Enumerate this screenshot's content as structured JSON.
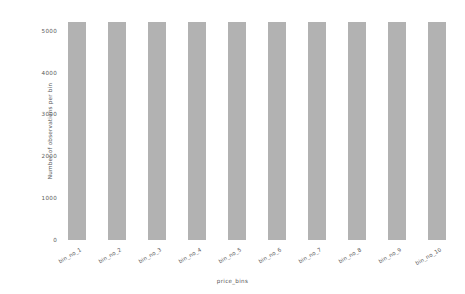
{
  "chart_data": {
    "type": "bar",
    "title": "",
    "categories": [
      "bin_no_1",
      "bin_no_2",
      "bin_no_3",
      "bin_no_4",
      "bin_no_5",
      "bin_no_6",
      "bin_no_7",
      "bin_no_8",
      "bin_no_9",
      "bin_no_10"
    ],
    "values": [
      5200,
      5200,
      5200,
      5200,
      5200,
      5200,
      5200,
      5200,
      5200,
      5200
    ],
    "xlabel": "price_bins",
    "ylabel": "Number of observations per bin",
    "ylim": [
      0,
      5350
    ],
    "yticks": [
      0,
      1000,
      2000,
      3000,
      4000,
      5000
    ],
    "ytick_labels": [
      "0",
      "1000",
      "2000",
      "3000",
      "4000",
      "5000"
    ],
    "grid": false,
    "legend": null,
    "bar_color": "#b2b2b2",
    "background_color": "#ffffff",
    "xtick_rotation": -30
  }
}
